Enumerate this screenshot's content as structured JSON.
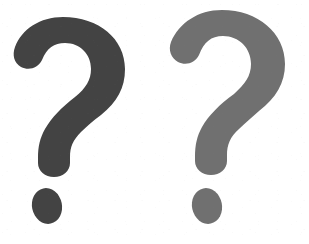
{
  "image": {
    "title": "Two question marks",
    "background_color": "#ffffff",
    "width": 309,
    "height": 244
  },
  "marks": [
    {
      "id": "left",
      "glyph": "?",
      "label": "dark question mark",
      "color": "#434343",
      "hook": {
        "x": 14,
        "y": 17,
        "width": 114,
        "height": 158
      },
      "dot": {
        "cx": 47,
        "cy": 206,
        "rx": 15,
        "ry": 18,
        "rotation": -12
      }
    },
    {
      "id": "right",
      "glyph": "?",
      "label": "gray question mark",
      "color": "#707070",
      "hook": {
        "x": 170,
        "y": 10,
        "width": 123,
        "height": 162
      },
      "dot": {
        "cx": 207,
        "cy": 206,
        "rx": 15,
        "ry": 18,
        "rotation": -12
      }
    }
  ]
}
